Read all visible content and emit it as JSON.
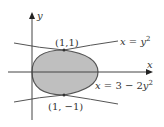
{
  "diagram": {
    "axes": {
      "x_label": "x",
      "y_label": "y"
    },
    "curves": [
      {
        "name": "x = y^2",
        "label_lhs": "x",
        "label_eq": "=",
        "label_rhs": "y",
        "label_sup": "2"
      },
      {
        "name": "x = 3 - 2y^2",
        "label_lhs": "x",
        "label_eq": "= 3 − 2",
        "label_rhs": "y",
        "label_sup": "2"
      }
    ],
    "points": [
      {
        "label": "(1,1)"
      },
      {
        "label": "(1, −1)"
      }
    ],
    "region_fill": "#bfbfbf",
    "line_color": "#555555"
  }
}
